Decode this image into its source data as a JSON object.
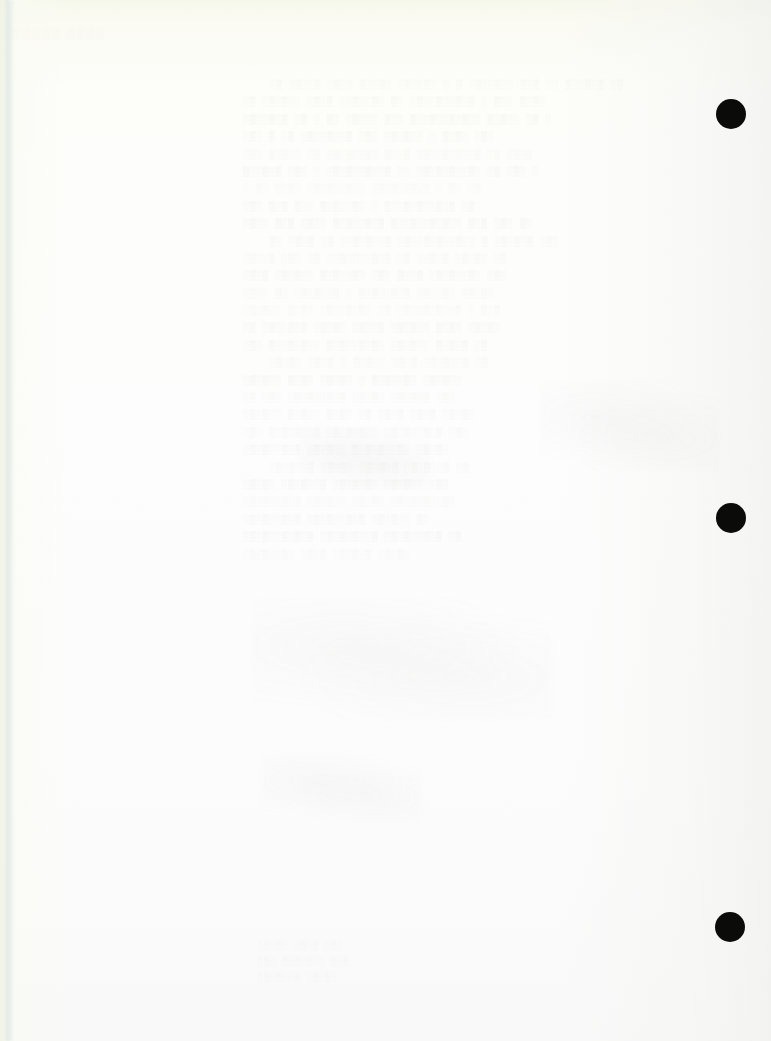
{
  "document": {
    "kind": "scanned-page",
    "page_width": 771,
    "page_height": 1041,
    "condition": "near-blank scanned sheet with reverse-side bleed-through",
    "paper_color": "#fdfdfa",
    "edge_tint_color": "#f2f6e2",
    "ink_ghost_color": "#92968c"
  },
  "corner_stamp": {
    "text": "░░░░░ ░░░░",
    "note": "illegible faint stamp impression"
  },
  "ghost_text_block": {
    "left": 243,
    "top": 76,
    "width": 452,
    "line_height": 17.4,
    "legible": false,
    "note": "mirror-image bleed-through from the reverse of the sheet; characters are not resolvable",
    "lines": [
      "░▒ ░▒░░▒ ░▒░░ ▒░░▒░ ░▒░░▒░  ░ ▒ ░▒░░▒░░ ▒░▒ ░░ ▒░░▒░▒ ░▒",
      " ░▒ ░▒░▒░░ ░▒░▒ ░░▒░░▒░ ▒░ ░▒░░▒░░▒░▒  ░ ▒░░ ▒░▒░",
      "░▒░░▒░▒ ░▒  ░ ▒░ ░▒░░░ ▒░░ ▒░░▒░░▒░▒░░ ▒░▒░░ ░▒ ░",
      " ░▒░ ▒  ░▒ ░▒░░▒░░▒   ░▒░ ░▒░▒░░  ░ ▒░▒░ ░▒░",
      "░▒░  ▒░▒░░  ░▒ ░▒░▒░░▒░ ▒░░▒ ░▒░░▒░▒░░▒ ░▒  ░▒░▒",
      "▒░░▒░▒  ░▒░  ░ ░▒░▒░░▒░░▒ ░░ ░▒░▒░▒░░▒░   ░▒  ░▒░ ░",
      "░ ▒░   ▒░▒░    ░▒░▒░░▒░░   ░▒░▒░░▒░▒  ░   ▒░  ░▒",
      " ░▒░  ▒░▒   ▒░░ ▒░▒░░▒░  ░ ▒░░▒░▒░░▒░▒    ░▒",
      "░▒░░ ▒░▒  ░▒░░ ▒░▒░░▒░▒  ▒░░▒░░▒░▒░░ ▒░▒   ░▒░  ▒░",
      "▒░ ░▒░▒  ░▒ ░░▒░▒░░▒   ░▒░░▒░▒░░▒░░   ▒ ░▒░▒░▒  ░▒░",
      " ░▒░░▒  ░▒░ ░▒ ░░▒░▒░░▒░▒  ░▒ ░░▒░▒  ░▒░▒░  ░▒",
      "░▒░▒   ░▒░▒░░ ▒░▒░░▒░  ░▒░ ▒░░▒   ░▒░▒░░▒░  ░▒░",
      "  ░▒░░ ▒░ ░▒░▒░░▒    ░ ▒░▒░░▒░▒  ░▒░░▒░  ░▒░▒░",
      " ░▒░▒░░  ▒░▒░  ░▒░░▒░▒░  ░▒ ░▒░░▒░▒░░▒  ░ ▒░▒",
      "░▒  ░▒░░▒░▒  ░▒░▒░  ░▒░░▒  ░▒░▒░░  ▒░▒░  ░▒░▒░",
      "  ░▒░ ▒░░▒░▒░░  ▒░▒░░▒░▒░   ░▒░▒░░ ▒░▒░▒  ░▒",
      " ░▒░▒░   ░▒░▒   ░ ▒░▒░░  ░▒░▒   ░▒░▒░░▒  ░▒",
      "   ░▒░▒░░  ▒░▒░  ░▒░▒░   ░ ▒░▒░░▒░   ░▒░▒░░",
      " ░▒  ░▒░   ░▒░▒░░▒░▒  ░▒░▒░    ░▒░▒░▒  ░▒░",
      "  ░▒░▒░░  ▒░▒░░ ▒░▒░  ░▒ ░▒░▒   ░▒░▒  ░▒░▒░",
      " ░▒░  ▒░▒░▒░░▒   ░▒░▒░▒░░  ░▒░▒░░▒░▒   ░▒░",
      "   ░▒░▒░░▒░▒   ░▒░▒░░  ▒░▒░▒░░▒░   ░▒░▒░",
      "  ░▒░▒░░▒  ░▒░▒░   ░▒░▒░▒  ░▒░▒░░▒   ░▒",
      "    ░▒░▒░  ░▒░▒░░▒   ░▒░▒░▒░  ░▒░▒░░  ░▒░",
      "  ░▒░▒░░▒░▒  ░▒░▒░░   ░▒░▒░   ░▒░▒░▒░░▒░",
      "      ░▒░▒░░▒░▒  ░▒░▒░░▒░▒   ░▒░▒░░  ▒░",
      "    ░▒░▒░░▒░▒░▒  ░▒░▒░▒░░▒   ░▒░▒░░▒░▒ ░▒",
      "        ░▒░▒░░▒░   ░▒░▒  ░▒░▒░▒   ░▒░▒░"
    ]
  },
  "lower_ghost": {
    "left": 258,
    "top": 938,
    "legible": false,
    "lines": [
      " ░▒░▒░ ░▒░▒  ░▒░",
      "░▒░  ▒░▒░▒░░ ▒░▒",
      " ░▒░▒░░▒  ░▒░▒░"
    ]
  },
  "punch_holes": [
    {
      "id": "punch-hole-top",
      "cx": 731,
      "cy": 114,
      "diameter": 30,
      "color": "#0b0b0a"
    },
    {
      "id": "punch-hole-middle",
      "cx": 731,
      "cy": 518,
      "diameter": 30,
      "color": "#0b0b0a"
    },
    {
      "id": "punch-hole-bottom",
      "cx": 730,
      "cy": 927,
      "diameter": 30,
      "color": "#0b0b0a"
    }
  ]
}
